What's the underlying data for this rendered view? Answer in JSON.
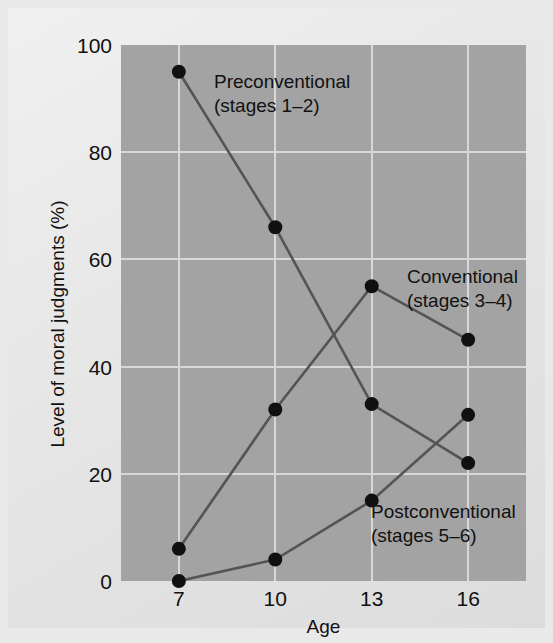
{
  "chart_data": {
    "type": "line",
    "title": "",
    "xlabel": "Age",
    "ylabel": "Level of moral judgments (%)",
    "x": [
      7,
      10,
      13,
      16
    ],
    "xtick_labels": [
      "7",
      "10",
      "13",
      "16"
    ],
    "ytick_labels": [
      "0",
      "20",
      "40",
      "60",
      "80",
      "100"
    ],
    "yticks": [
      0,
      20,
      40,
      60,
      80,
      100
    ],
    "xlim": [
      5.2,
      17.8
    ],
    "ylim": [
      0,
      100
    ],
    "grid": true,
    "legend_position": "inline-annotations",
    "plot_background": "#a3a3a3",
    "gridline_color": "#d8d8d8",
    "line_color": "#545454",
    "marker_color": "#101010",
    "series": [
      {
        "name": "Preconventional",
        "sublabel": "(stages 1–2)",
        "values": [
          95,
          66,
          33,
          22
        ]
      },
      {
        "name": "Conventional",
        "sublabel": "(stages 3–4)",
        "values": [
          6,
          32,
          55,
          45
        ]
      },
      {
        "name": "Postconventional",
        "sublabel": "(stages 5–6)",
        "values": [
          0,
          4,
          15,
          31
        ]
      }
    ],
    "annotations": [
      {
        "text": "Preconventional",
        "sub": "(stages 1–2)",
        "x": 206,
        "y": 62
      },
      {
        "text": "Conventional",
        "sub": "(stages 3–4)",
        "x": 399,
        "y": 257
      },
      {
        "text": "Postconventional",
        "sub": "(stages 5–6)",
        "x": 363,
        "y": 492
      }
    ]
  }
}
